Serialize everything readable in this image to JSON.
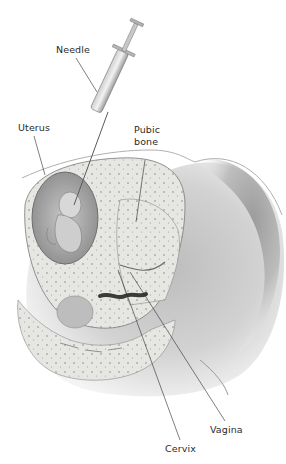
{
  "diagram": {
    "labels": {
      "needle": "Needle",
      "uterus": "Uterus",
      "pubic_bone_line1": "Pubic",
      "pubic_bone_line2": "bone",
      "vagina": "Vagina",
      "cervix": "Cervix"
    },
    "colors": {
      "background": "#ffffff",
      "skin_dark": "#9a9a9a",
      "skin_light": "#d6d6d6",
      "tissue": "#e4e4e0",
      "tissue_dots": "#8a8a8a",
      "amniotic": "#b8b8b8",
      "fetus": "#cfcfcf",
      "leader_line": "#2a2a2a",
      "label_text": "#2a2a2a"
    }
  }
}
